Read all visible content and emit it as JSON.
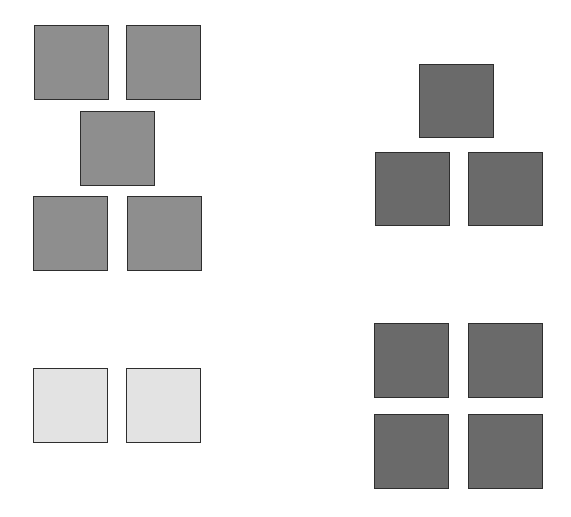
{
  "canvas": {
    "width": 571,
    "height": 517,
    "background": "#ffffff"
  },
  "colors": {
    "medium_gray": "#8e8e8e",
    "dark_gray": "#6a6a6a",
    "light_gray": "#e3e3e3",
    "border": "#2e2e2e"
  },
  "groups": [
    {
      "name": "top-left-five-squares",
      "count": 5,
      "fill": "medium_gray",
      "squares": [
        {
          "x": 34,
          "y": 25,
          "w": 75,
          "h": 75
        },
        {
          "x": 126,
          "y": 25,
          "w": 75,
          "h": 75
        },
        {
          "x": 80,
          "y": 111,
          "w": 75,
          "h": 75
        },
        {
          "x": 33,
          "y": 196,
          "w": 75,
          "h": 75
        },
        {
          "x": 127,
          "y": 196,
          "w": 75,
          "h": 75
        }
      ]
    },
    {
      "name": "top-right-three-squares",
      "count": 3,
      "fill": "dark_gray",
      "squares": [
        {
          "x": 419,
          "y": 64,
          "w": 75,
          "h": 74
        },
        {
          "x": 375,
          "y": 152,
          "w": 75,
          "h": 74
        },
        {
          "x": 468,
          "y": 152,
          "w": 75,
          "h": 74
        }
      ]
    },
    {
      "name": "bottom-left-two-squares",
      "count": 2,
      "fill": "light_gray",
      "squares": [
        {
          "x": 33,
          "y": 368,
          "w": 75,
          "h": 75
        },
        {
          "x": 126,
          "y": 368,
          "w": 75,
          "h": 75
        }
      ]
    },
    {
      "name": "bottom-right-four-squares",
      "count": 4,
      "fill": "dark_gray",
      "squares": [
        {
          "x": 374,
          "y": 323,
          "w": 75,
          "h": 75
        },
        {
          "x": 468,
          "y": 323,
          "w": 75,
          "h": 75
        },
        {
          "x": 374,
          "y": 414,
          "w": 75,
          "h": 75
        },
        {
          "x": 468,
          "y": 414,
          "w": 75,
          "h": 75
        }
      ]
    }
  ]
}
